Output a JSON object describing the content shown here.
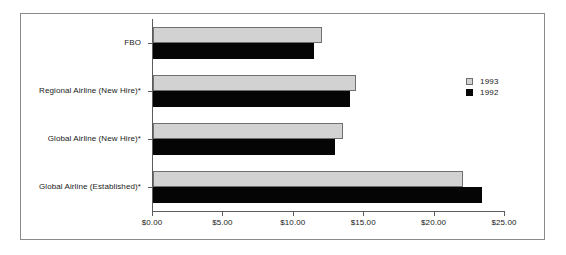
{
  "chart_data": {
    "type": "bar",
    "orientation": "horizontal",
    "title": "",
    "xlabel": "",
    "ylabel": "",
    "categories": [
      "FBO",
      "Regional Airline (New Hire)*",
      "Global Airline (New Hire)*",
      "Global Airline (Established)*"
    ],
    "series": [
      {
        "name": "1993",
        "color": "#d2d2d2",
        "values": [
          12.0,
          14.4,
          13.5,
          22.0
        ]
      },
      {
        "name": "1992",
        "color": "#050505",
        "values": [
          11.4,
          14.0,
          12.9,
          23.4
        ]
      }
    ],
    "xlim": [
      0,
      25
    ],
    "xticks": [
      0,
      5,
      10,
      15,
      20,
      25
    ],
    "xtick_labels": [
      "$0.00",
      "$5.00",
      "$10.00",
      "$15.00",
      "$20.00",
      "$25.00"
    ],
    "grid": false,
    "legend_position": "right"
  },
  "legend": {
    "entries": [
      {
        "label": "1993"
      },
      {
        "label": "1992"
      }
    ]
  }
}
